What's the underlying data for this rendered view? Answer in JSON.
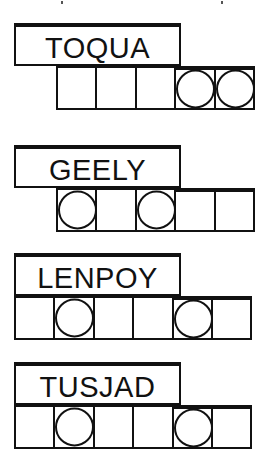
{
  "puzzles": [
    {
      "word": "TOQUA",
      "top": 23,
      "cells_left": 56,
      "cells": [
        {
          "circled": false,
          "bar": false
        },
        {
          "circled": false,
          "bar": false
        },
        {
          "circled": false,
          "bar": false
        },
        {
          "circled": true,
          "bar": true
        },
        {
          "circled": true,
          "bar": true
        }
      ]
    },
    {
      "word": "GEELY",
      "top": 145,
      "cells_left": 56,
      "cells": [
        {
          "circled": true,
          "bar": false
        },
        {
          "circled": false,
          "bar": false
        },
        {
          "circled": true,
          "bar": false
        },
        {
          "circled": false,
          "bar": true
        },
        {
          "circled": false,
          "bar": true
        }
      ]
    },
    {
      "word": "LENPOY",
      "top": 253,
      "cells_left": 14,
      "cells": [
        {
          "circled": false,
          "bar": false
        },
        {
          "circled": true,
          "bar": false
        },
        {
          "circled": false,
          "bar": false
        },
        {
          "circled": false,
          "bar": false
        },
        {
          "circled": true,
          "bar": true
        },
        {
          "circled": false,
          "bar": true
        }
      ]
    },
    {
      "word": "TUSJAD",
      "top": 362,
      "cells_left": 14,
      "cells": [
        {
          "circled": false,
          "bar": false
        },
        {
          "circled": true,
          "bar": false
        },
        {
          "circled": false,
          "bar": false
        },
        {
          "circled": false,
          "bar": false
        },
        {
          "circled": true,
          "bar": true
        },
        {
          "circled": false,
          "bar": true
        }
      ]
    }
  ]
}
